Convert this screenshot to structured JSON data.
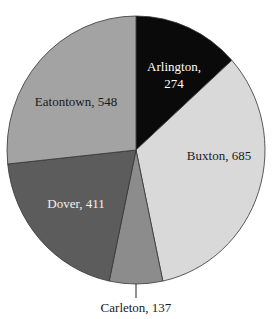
{
  "chart_data": {
    "type": "pie",
    "title": "",
    "categories": [
      "Arlington",
      "Buxton",
      "Carleton",
      "Dover",
      "Eatontown"
    ],
    "values": [
      274,
      685,
      137,
      411,
      548
    ],
    "total": 2055,
    "start_angle_deg": 0,
    "direction": "clockwise",
    "colors": [
      "#0a0a0a",
      "#d9d9d9",
      "#8c8c8c",
      "#5c5c5c",
      "#a3a3a3"
    ],
    "label_colors": [
      "#ffffff",
      "#1a1a1a",
      "#1a1a1a",
      "#ffffff",
      "#1a1a1a"
    ],
    "labels": [
      "Arlington, 274",
      "Buxton, 685",
      "Carleton, 137",
      "Dover, 411",
      "Eatontown, 548"
    ],
    "legend": "none (labels on slices)"
  },
  "labels": {
    "arlington_line1": "Arlington,",
    "arlington_line2": "274",
    "buxton": "Buxton, 685",
    "carleton": "Carleton, 137",
    "dover": "Dover, 411",
    "eatontown": "Eatontown, 548"
  }
}
